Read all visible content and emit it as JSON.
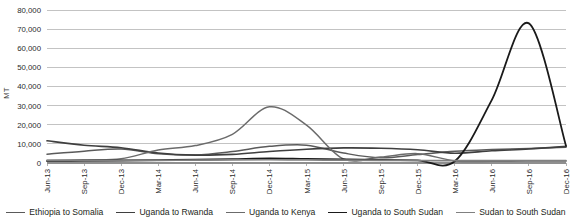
{
  "chart_data": {
    "type": "line",
    "title": "",
    "xlabel": "",
    "ylabel": "MT",
    "ylim": [
      0,
      80000
    ],
    "ytick_step": 10000,
    "grid": true,
    "legend_position": "bottom",
    "categories": [
      "Jun-13",
      "Sep-13",
      "Dec-13",
      "Mar-14",
      "Jun-14",
      "Sep-14",
      "Dec-14",
      "Mar-15",
      "Jun-15",
      "Sep-15",
      "Dec-15",
      "Mar-16",
      "Jun-16",
      "Sep-16",
      "Dec-16"
    ],
    "ytick_labels": [
      "80,000",
      "70,000",
      "60,000",
      "50,000",
      "40,000",
      "30,000",
      "20,000",
      "10,000",
      "0"
    ],
    "ytick_values": [
      80000,
      70000,
      60000,
      50000,
      40000,
      30000,
      20000,
      10000,
      0
    ],
    "series": [
      {
        "name": "Ethiopia to Somalia",
        "color": "#5a5a5a",
        "width": 1.5,
        "values": [
          4600,
          6200,
          7300,
          4900,
          4200,
          6000,
          8700,
          9300,
          5200,
          2700,
          4400,
          6100,
          7000,
          7600,
          8200
        ]
      },
      {
        "name": "Uganda to Rwanda",
        "color": "#3f3f3f",
        "width": 1.6,
        "values": [
          11600,
          9300,
          8000,
          5200,
          4100,
          4500,
          6000,
          7200,
          7900,
          7700,
          6900,
          5100,
          6400,
          7300,
          8700
        ]
      },
      {
        "name": "Uganda to Kenya",
        "color": "#6b6b6b",
        "width": 1.5,
        "values": [
          1500,
          1700,
          2200,
          6800,
          9100,
          15000,
          29400,
          19800,
          2100,
          3100,
          4900,
          1100,
          900,
          1000,
          1100
        ]
      },
      {
        "name": "Uganda to South Sudan",
        "color": "#1a1a1a",
        "width": 1.8,
        "values": [
          1000,
          1100,
          1300,
          1500,
          1700,
          2000,
          2400,
          2100,
          1900,
          1600,
          1400,
          900,
          33000,
          73000,
          9000
        ]
      },
      {
        "name": "Sudan to South Sudan",
        "color": "#808080",
        "width": 1.7,
        "values": [
          1200,
          1200,
          1300,
          1400,
          1500,
          1600,
          1700,
          1600,
          1500,
          1400,
          1300,
          1200,
          1200,
          1200,
          1200
        ]
      }
    ]
  }
}
